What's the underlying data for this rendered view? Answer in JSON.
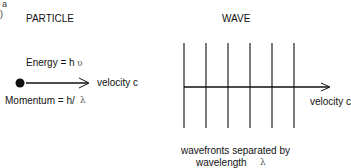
{
  "corner_label": "a",
  "corner_paren": ")",
  "particle": {
    "title": "PARTICLE",
    "energy_label": "Energy = h",
    "energy_symbol": "υ",
    "velocity_label": "velocity c",
    "momentum_label": "Momentum = h/",
    "momentum_symbol": "λ"
  },
  "wave": {
    "title": "WAVE",
    "velocity_label": "velocity c",
    "caption_line1": "wavefronts separated by",
    "caption_line2": "wavelength",
    "caption_symbol": "λ",
    "wavefront_count": 6
  },
  "colors": {
    "ink": "#111111",
    "background": "#ffffff"
  }
}
